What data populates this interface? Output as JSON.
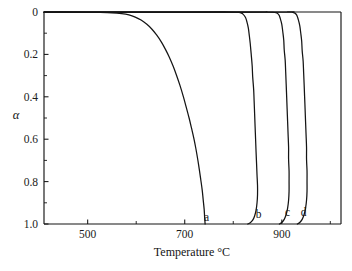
{
  "figure": {
    "background": "#ffffff",
    "ink_color": "#141414"
  },
  "chart_data": {
    "type": "line",
    "title": "",
    "subtitle": "",
    "xlabel": "Temperature °C",
    "ylabel": "α",
    "xlim": [
      410,
      1022
    ],
    "ylim": [
      0,
      1
    ],
    "y_axis_inverted": true,
    "grid": false,
    "legend_position": "inline-curve-end-labels",
    "x_ticks_major": [
      500,
      700,
      900
    ],
    "x_tick_labels": [
      "500",
      "700",
      "900"
    ],
    "x_ticks_minor": [
      600,
      800,
      1000
    ],
    "y_ticks_major": [
      0,
      0.2,
      0.4,
      0.6,
      0.8,
      1.0
    ],
    "y_tick_labels": [
      "0",
      "0.2",
      "0.4",
      "0.6",
      "0.8",
      "1.0"
    ],
    "y_ticks_minor": [
      0.1,
      0.3,
      0.5,
      0.7,
      0.9
    ],
    "annotations": [
      {
        "text": "a",
        "x": 745,
        "y": 0.965
      },
      {
        "text": "b",
        "x": 852,
        "y": 0.955
      },
      {
        "text": "c",
        "x": 912,
        "y": 0.945
      },
      {
        "text": "d",
        "x": 945,
        "y": 0.945
      }
    ],
    "series": [
      {
        "name": "a",
        "label": "a",
        "color": "#141414",
        "points": [
          [
            410,
            0.0
          ],
          [
            470,
            0.0
          ],
          [
            520,
            0.002
          ],
          [
            550,
            0.004
          ],
          [
            570,
            0.008
          ],
          [
            585,
            0.014
          ],
          [
            598,
            0.024
          ],
          [
            610,
            0.038
          ],
          [
            622,
            0.058
          ],
          [
            632,
            0.08
          ],
          [
            642,
            0.108
          ],
          [
            652,
            0.142
          ],
          [
            660,
            0.175
          ],
          [
            668,
            0.212
          ],
          [
            676,
            0.255
          ],
          [
            683,
            0.298
          ],
          [
            690,
            0.345
          ],
          [
            697,
            0.398
          ],
          [
            703,
            0.448
          ],
          [
            709,
            0.5
          ],
          [
            714,
            0.548
          ],
          [
            719,
            0.598
          ],
          [
            723,
            0.645
          ],
          [
            727,
            0.698
          ],
          [
            730,
            0.742
          ],
          [
            733,
            0.79
          ],
          [
            736,
            0.84
          ],
          [
            738,
            0.885
          ],
          [
            740,
            0.93
          ],
          [
            741,
            0.968
          ],
          [
            742,
            1.0
          ]
        ]
      },
      {
        "name": "b",
        "label": "b",
        "color": "#141414",
        "points": [
          [
            410,
            0.0
          ],
          [
            700,
            0.0
          ],
          [
            790,
            0.0
          ],
          [
            812,
            0.002
          ],
          [
            820,
            0.01
          ],
          [
            825,
            0.025
          ],
          [
            828,
            0.045
          ],
          [
            831,
            0.075
          ],
          [
            833,
            0.11
          ],
          [
            835,
            0.15
          ],
          [
            837,
            0.2
          ],
          [
            839,
            0.255
          ],
          [
            840,
            0.305
          ],
          [
            842,
            0.365
          ],
          [
            843,
            0.42
          ],
          [
            844,
            0.48
          ],
          [
            845,
            0.54
          ],
          [
            846,
            0.6
          ],
          [
            847,
            0.66
          ],
          [
            848,
            0.715
          ],
          [
            849,
            0.77
          ],
          [
            850,
            0.82
          ],
          [
            850,
            0.862
          ],
          [
            849,
            0.9
          ],
          [
            847,
            0.935
          ],
          [
            844,
            0.962
          ],
          [
            840,
            0.982
          ],
          [
            835,
            0.994
          ],
          [
            830,
            1.0
          ]
        ]
      },
      {
        "name": "c",
        "label": "c",
        "color": "#141414",
        "points": [
          [
            410,
            0.0
          ],
          [
            820,
            0.0
          ],
          [
            870,
            0.0
          ],
          [
            888,
            0.003
          ],
          [
            894,
            0.014
          ],
          [
            897,
            0.032
          ],
          [
            900,
            0.058
          ],
          [
            902,
            0.092
          ],
          [
            904,
            0.132
          ],
          [
            905,
            0.178
          ],
          [
            907,
            0.228
          ],
          [
            908,
            0.282
          ],
          [
            909,
            0.338
          ],
          [
            910,
            0.398
          ],
          [
            911,
            0.458
          ],
          [
            912,
            0.518
          ],
          [
            913,
            0.578
          ],
          [
            914,
            0.638
          ],
          [
            914,
            0.695
          ],
          [
            915,
            0.75
          ],
          [
            915,
            0.8
          ],
          [
            915,
            0.845
          ],
          [
            914,
            0.888
          ],
          [
            912,
            0.925
          ],
          [
            909,
            0.955
          ],
          [
            905,
            0.978
          ],
          [
            900,
            0.993
          ],
          [
            895,
            1.0
          ]
        ]
      },
      {
        "name": "d",
        "label": "d",
        "color": "#141414",
        "points": [
          [
            410,
            0.0
          ],
          [
            880,
            0.0
          ],
          [
            912,
            0.0
          ],
          [
            926,
            0.004
          ],
          [
            931,
            0.016
          ],
          [
            934,
            0.036
          ],
          [
            937,
            0.064
          ],
          [
            939,
            0.098
          ],
          [
            941,
            0.138
          ],
          [
            942,
            0.182
          ],
          [
            944,
            0.232
          ],
          [
            945,
            0.285
          ],
          [
            946,
            0.34
          ],
          [
            947,
            0.398
          ],
          [
            948,
            0.458
          ],
          [
            949,
            0.518
          ],
          [
            950,
            0.578
          ],
          [
            951,
            0.638
          ],
          [
            951,
            0.695
          ],
          [
            952,
            0.75
          ],
          [
            952,
            0.8
          ],
          [
            952,
            0.845
          ],
          [
            951,
            0.888
          ],
          [
            949,
            0.925
          ],
          [
            946,
            0.955
          ],
          [
            942,
            0.978
          ],
          [
            937,
            0.993
          ],
          [
            932,
            1.0
          ]
        ]
      }
    ]
  }
}
